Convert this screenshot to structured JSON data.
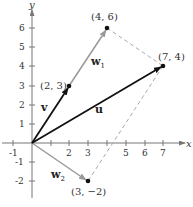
{
  "axes": {
    "x_label": "x",
    "y_label": "y",
    "x_ticks": [
      "-1",
      "2",
      "3",
      "5",
      "6",
      "7"
    ],
    "y_ticks": [
      "6",
      "5",
      "4",
      "3",
      "2",
      "1",
      "-1",
      "-2"
    ]
  },
  "vectors": {
    "u": {
      "label": "u",
      "from": [
        0,
        0
      ],
      "to": [
        7,
        4
      ],
      "color": "#111111"
    },
    "v": {
      "label": "v",
      "from": [
        0,
        0
      ],
      "to": [
        2,
        3
      ],
      "color": "#111111"
    },
    "w1": {
      "label": "w",
      "sub": "1",
      "from": [
        2,
        3
      ],
      "to": [
        4,
        6
      ],
      "color": "#999999"
    },
    "w2": {
      "label": "w",
      "sub": "2",
      "from": [
        0,
        0
      ],
      "to": [
        3,
        -2
      ],
      "color": "#999999"
    }
  },
  "points": {
    "p1": "(2, 3)",
    "p2": "(4, 6)",
    "p3": "(7, 4)",
    "p4": "(3, −2)"
  },
  "dashed_lines": [
    {
      "from": [
        4,
        6
      ],
      "to": [
        7,
        4
      ]
    },
    {
      "from": [
        7,
        4
      ],
      "to": [
        3,
        -2
      ]
    }
  ]
}
